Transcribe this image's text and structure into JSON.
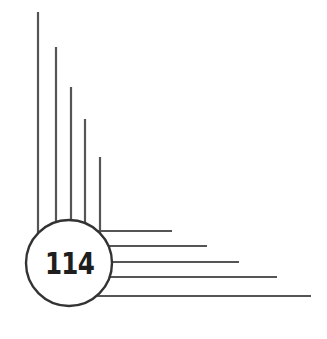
{
  "page_number": "114",
  "colors": {
    "line": "#555555",
    "circle_stroke": "#333333",
    "text": "#1e1e1e",
    "background": "#ffffff"
  },
  "decoration": {
    "vertical_lines": [
      {
        "x": 38,
        "top": 12
      },
      {
        "x": 56,
        "top": 47
      },
      {
        "x": 71,
        "top": 87
      },
      {
        "x": 85,
        "top": 119
      },
      {
        "x": 100,
        "top": 157
      }
    ],
    "horizontal_lines": [
      {
        "y": 231,
        "end": 172
      },
      {
        "y": 246,
        "end": 207
      },
      {
        "y": 262,
        "end": 239
      },
      {
        "y": 277,
        "end": 277
      },
      {
        "y": 296,
        "end": 311
      }
    ]
  }
}
